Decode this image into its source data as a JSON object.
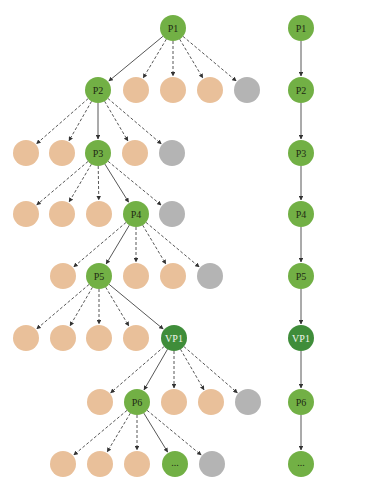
{
  "colors": {
    "path_node": "#72b045",
    "virtual_node": "#3f8d3a",
    "candidate_node": "#e9c09a",
    "pruned_node": "#b4b4b4",
    "edge": "#444444"
  },
  "node_radius": 13,
  "left_tree": {
    "rows": [
      {
        "y": 28,
        "parent": null,
        "nodes": [
          {
            "x": 173,
            "type": "path",
            "label": "P1"
          }
        ]
      },
      {
        "y": 90,
        "parent": 0,
        "nodes": [
          {
            "x": 98,
            "type": "path",
            "label": "P2",
            "edge": "solid"
          },
          {
            "x": 136,
            "type": "candidate",
            "label": "",
            "edge": "dashed"
          },
          {
            "x": 173,
            "type": "candidate",
            "label": "",
            "edge": "dashed"
          },
          {
            "x": 210,
            "type": "candidate",
            "label": "",
            "edge": "dashed"
          },
          {
            "x": 247,
            "type": "pruned",
            "label": "",
            "edge": "dashed"
          }
        ]
      },
      {
        "y": 153,
        "parent": 0,
        "nodes": [
          {
            "x": 26,
            "type": "candidate",
            "label": "",
            "edge": "dashed"
          },
          {
            "x": 62,
            "type": "candidate",
            "label": "",
            "edge": "dashed"
          },
          {
            "x": 98,
            "type": "path",
            "label": "P3",
            "edge": "solid"
          },
          {
            "x": 135,
            "type": "candidate",
            "label": "",
            "edge": "dashed"
          },
          {
            "x": 172,
            "type": "pruned",
            "label": "",
            "edge": "dashed"
          }
        ]
      },
      {
        "y": 214,
        "parent": 2,
        "nodes": [
          {
            "x": 26,
            "type": "candidate",
            "label": "",
            "edge": "dashed"
          },
          {
            "x": 62,
            "type": "candidate",
            "label": "",
            "edge": "dashed"
          },
          {
            "x": 99,
            "type": "candidate",
            "label": "",
            "edge": "dashed"
          },
          {
            "x": 136,
            "type": "path",
            "label": "P4",
            "edge": "solid"
          },
          {
            "x": 172,
            "type": "pruned",
            "label": "",
            "edge": "dashed"
          }
        ]
      },
      {
        "y": 276,
        "parent": 3,
        "nodes": [
          {
            "x": 63,
            "type": "candidate",
            "label": "",
            "edge": "dashed"
          },
          {
            "x": 99,
            "type": "path",
            "label": "P5",
            "edge": "solid"
          },
          {
            "x": 136,
            "type": "candidate",
            "label": "",
            "edge": "dashed"
          },
          {
            "x": 173,
            "type": "candidate",
            "label": "",
            "edge": "dashed"
          },
          {
            "x": 210,
            "type": "pruned",
            "label": "",
            "edge": "dashed"
          }
        ]
      },
      {
        "y": 338,
        "parent": 1,
        "nodes": [
          {
            "x": 26,
            "type": "candidate",
            "label": "",
            "edge": "dashed"
          },
          {
            "x": 63,
            "type": "candidate",
            "label": "",
            "edge": "dashed"
          },
          {
            "x": 99,
            "type": "candidate",
            "label": "",
            "edge": "dashed"
          },
          {
            "x": 136,
            "type": "candidate",
            "label": "",
            "edge": "dashed"
          },
          {
            "x": 174,
            "type": "virtual",
            "label": "VP1",
            "edge": "solid"
          }
        ]
      },
      {
        "y": 402,
        "parent": 4,
        "nodes": [
          {
            "x": 100,
            "type": "candidate",
            "label": "",
            "edge": "dashed"
          },
          {
            "x": 137,
            "type": "path",
            "label": "P6",
            "edge": "solid"
          },
          {
            "x": 174,
            "type": "candidate",
            "label": "",
            "edge": "dashed"
          },
          {
            "x": 211,
            "type": "candidate",
            "label": "",
            "edge": "dashed"
          },
          {
            "x": 248,
            "type": "pruned",
            "label": "",
            "edge": "dashed"
          }
        ]
      },
      {
        "y": 464,
        "parent": 1,
        "nodes": [
          {
            "x": 63,
            "type": "candidate",
            "label": "",
            "edge": "dashed"
          },
          {
            "x": 100,
            "type": "candidate",
            "label": "",
            "edge": "dashed"
          },
          {
            "x": 137,
            "type": "candidate",
            "label": "",
            "edge": "dashed"
          },
          {
            "x": 175,
            "type": "path",
            "label": "...",
            "edge": "solid"
          },
          {
            "x": 212,
            "type": "pruned",
            "label": "",
            "edge": "dashed"
          }
        ]
      }
    ]
  },
  "right_chain": {
    "x": 301,
    "nodes": [
      {
        "y": 28,
        "type": "path",
        "label": "P1"
      },
      {
        "y": 90,
        "type": "path",
        "label": "P2"
      },
      {
        "y": 153,
        "type": "path",
        "label": "P3"
      },
      {
        "y": 214,
        "type": "path",
        "label": "P4"
      },
      {
        "y": 276,
        "type": "path",
        "label": "P5"
      },
      {
        "y": 338,
        "type": "virtual",
        "label": "VP1"
      },
      {
        "y": 402,
        "type": "path",
        "label": "P6"
      },
      {
        "y": 464,
        "type": "path",
        "label": "..."
      }
    ]
  }
}
